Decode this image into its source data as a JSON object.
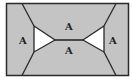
{
  "diagram": {
    "colors": {
      "fill": "#c4c4c4",
      "hole": "#ffffff",
      "stroke": "#2a2a2a"
    },
    "labels": [
      {
        "id": "left",
        "text": "A"
      },
      {
        "id": "top",
        "text": "A"
      },
      {
        "id": "bottom",
        "text": "A"
      },
      {
        "id": "right",
        "text": "A"
      }
    ]
  }
}
